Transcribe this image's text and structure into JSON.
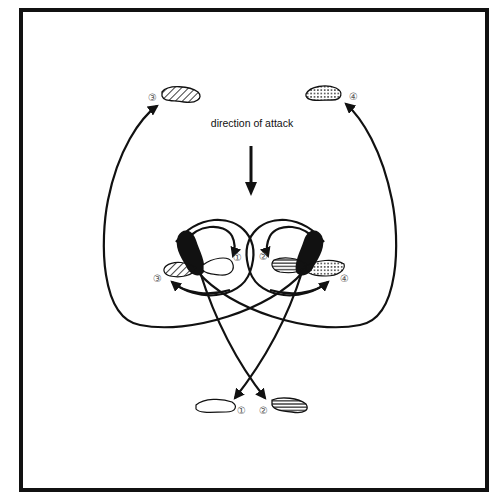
{
  "diagram": {
    "title_label": "direction of attack",
    "colors": {
      "ink": "#111111",
      "background": "#ffffff",
      "number_gray": "#555555"
    },
    "foot_markers": {
      "start_left_shoe": "black (solid)",
      "start_right_shoe": "black (solid)"
    },
    "positions": [
      {
        "id": "1",
        "label": "①",
        "fill": "plain (white)",
        "where": "bottom-left, after moving back-left"
      },
      {
        "id": "2",
        "label": "②",
        "fill": "horizontal stripes",
        "where": "bottom-right, after moving back-right"
      },
      {
        "id": "3",
        "label": "③",
        "fill": "diagonal hatch",
        "where": "top-left, after circling forward-left"
      },
      {
        "id": "4",
        "label": "④",
        "fill": "dots",
        "where": "top-right, after circling forward-right"
      }
    ],
    "center_labels": {
      "left_1": "①",
      "left_3": "③",
      "right_2": "②",
      "right_4": "④"
    },
    "outer_labels": {
      "top_3": "③",
      "top_4": "④",
      "bottom_1": "①",
      "bottom_2": "②"
    }
  }
}
